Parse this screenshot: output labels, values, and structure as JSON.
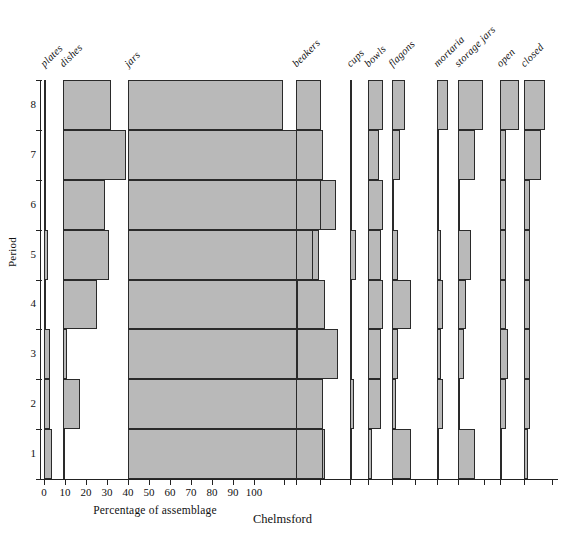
{
  "caption": "Chelmsford",
  "axes": {
    "ylabel": "Period",
    "xlabel": "Percentage of assemblage",
    "yticks": [
      "8",
      "7",
      "6",
      "5",
      "4",
      "3",
      "2",
      "1"
    ],
    "xticks": [
      "0",
      "10",
      "20",
      "30",
      "40",
      "50",
      "60",
      "70",
      "80",
      "90",
      "100"
    ],
    "colors": {
      "bar_fill": "#b9b9b9",
      "bar_stroke": "#2a2a2a",
      "axis": "#222222"
    }
  },
  "chart_data": {
    "type": "bar",
    "title": "Chelmsford",
    "subtitle": "",
    "xlabel": "Percentage of assemblage",
    "ylabel": "Period",
    "xlim": [
      0,
      100
    ],
    "grid": false,
    "legend": "none",
    "orientation": "horizontal",
    "layout": "small-multiples-by-vessel-class",
    "categories": [
      "1",
      "2",
      "3",
      "4",
      "5",
      "6",
      "7",
      "8"
    ],
    "category_order": "bottom-to-top",
    "series": [
      {
        "name": "plates",
        "values": [
          4,
          3,
          3,
          1,
          2,
          0,
          1,
          1
        ]
      },
      {
        "name": "dishes",
        "values": [
          1,
          8,
          2,
          16,
          22,
          20,
          30,
          23
        ]
      },
      {
        "name": "jars",
        "values": [
          94,
          90,
          100,
          94,
          91,
          99,
          87,
          74
        ]
      },
      {
        "name": "beakers",
        "values": [
          13,
          13,
          1,
          1,
          8,
          12,
          13,
          12
        ]
      },
      {
        "name": "cups",
        "values": [
          1,
          2,
          1,
          1,
          3,
          1,
          1,
          1
        ]
      },
      {
        "name": "bowls",
        "values": [
          2,
          6,
          6,
          7,
          6,
          7,
          5,
          7
        ]
      },
      {
        "name": "flagons",
        "values": [
          9,
          2,
          3,
          9,
          3,
          1,
          4,
          6
        ]
      },
      {
        "name": "mortaria",
        "values": [
          1,
          3,
          2,
          3,
          2,
          1,
          1,
          5
        ]
      },
      {
        "name": "storage jars",
        "values": [
          8,
          1,
          3,
          4,
          6,
          1,
          8,
          12
        ]
      },
      {
        "name": "open",
        "values": [
          1,
          3,
          4,
          3,
          3,
          3,
          3,
          9
        ]
      },
      {
        "name": "closed",
        "values": [
          2,
          3,
          3,
          3,
          3,
          3,
          8,
          10
        ]
      }
    ]
  },
  "columns": [
    {
      "label": "plates"
    },
    {
      "label": "dishes"
    },
    {
      "label": "jars"
    },
    {
      "label": "beakers"
    },
    {
      "label": "cups"
    },
    {
      "label": "bowls"
    },
    {
      "label": "flagons"
    },
    {
      "label": "mortaria"
    },
    {
      "label": "storage jars"
    },
    {
      "label": "open"
    },
    {
      "label": "closed"
    }
  ]
}
